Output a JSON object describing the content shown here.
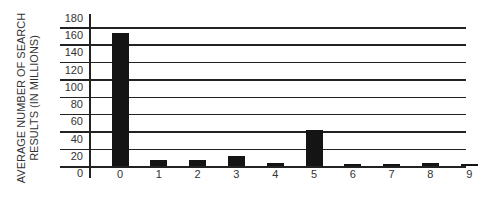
{
  "chart_data": {
    "type": "bar",
    "title": "",
    "xlabel": "",
    "ylabel": "AVERAGE NUMBER OF SEARCH RESULTS (IN MILLIONS)",
    "ylabel_lines": [
      "AVERAGE NUMBER OF SEARCH",
      "RESULTS (IN MILLIONS)"
    ],
    "categories": [
      "0",
      "1",
      "2",
      "3",
      "4",
      "5",
      "6",
      "7",
      "8",
      "9"
    ],
    "values": [
      155,
      7,
      7,
      12,
      4,
      42,
      2,
      2,
      3,
      2
    ],
    "yticks": [
      0,
      20,
      40,
      60,
      80,
      100,
      120,
      140,
      160,
      180
    ],
    "ylim": [
      0,
      180
    ],
    "grid": true,
    "legend": null,
    "bar_color": "#141414"
  }
}
